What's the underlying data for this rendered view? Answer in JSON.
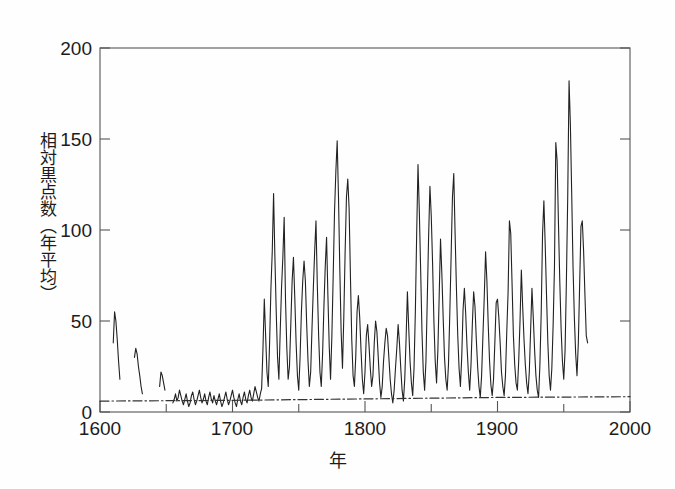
{
  "chart_data": {
    "type": "line",
    "title": "",
    "xlabel": "年",
    "ylabel": "相対黒点数（年平均）",
    "xlim": [
      1600,
      2000
    ],
    "ylim": [
      0,
      200
    ],
    "xticks": [
      1600,
      1700,
      1800,
      1900,
      2000
    ],
    "xtick_labels": [
      "1600",
      "1700",
      "1800",
      "1900",
      "2000"
    ],
    "xminor_step": 50,
    "yticks": [
      0,
      50,
      100,
      150,
      200
    ],
    "ytick_labels": [
      "0",
      "50",
      "100",
      "150",
      "200"
    ],
    "grid": false,
    "legend": null,
    "series": [
      {
        "name": "相対黒点数（年平均）",
        "style": "solid",
        "color": "#222222",
        "segments": [
          {
            "name": "1610-1615 fragment",
            "x": [
              1610,
              1611,
              1612,
              1613,
              1614,
              1615
            ],
            "values": [
              38,
              55,
              50,
              40,
              28,
              18
            ]
          },
          {
            "name": "1626-1632 fragment",
            "x": [
              1626,
              1627,
              1628,
              1629,
              1630,
              1631,
              1632
            ],
            "values": [
              30,
              35,
              32,
              25,
              20,
              14,
              10
            ]
          },
          {
            "name": "1645-1650 fragment",
            "x": [
              1645,
              1646,
              1647,
              1648,
              1649
            ],
            "values": [
              14,
              22,
              20,
              16,
              12
            ]
          },
          {
            "name": "1655-1985 continuous record",
            "x": [
              1655,
              1656,
              1657,
              1658,
              1659,
              1660,
              1661,
              1662,
              1663,
              1664,
              1665,
              1666,
              1667,
              1668,
              1669,
              1670,
              1671,
              1672,
              1673,
              1674,
              1675,
              1676,
              1677,
              1678,
              1679,
              1680,
              1681,
              1682,
              1683,
              1684,
              1685,
              1686,
              1687,
              1688,
              1689,
              1690,
              1691,
              1692,
              1693,
              1694,
              1695,
              1696,
              1697,
              1698,
              1699,
              1700,
              1701,
              1702,
              1703,
              1704,
              1705,
              1706,
              1707,
              1708,
              1709,
              1710,
              1711,
              1712,
              1713,
              1714,
              1715,
              1716,
              1717,
              1718,
              1719,
              1720,
              1721,
              1722,
              1723,
              1724,
              1725,
              1726,
              1727,
              1728,
              1729,
              1730,
              1731,
              1732,
              1733,
              1734,
              1735,
              1736,
              1737,
              1738,
              1739,
              1740,
              1741,
              1742,
              1743,
              1744,
              1745,
              1746,
              1747,
              1748,
              1749,
              1750,
              1751,
              1752,
              1753,
              1754,
              1755,
              1756,
              1757,
              1758,
              1759,
              1760,
              1761,
              1762,
              1763,
              1764,
              1765,
              1766,
              1767,
              1768,
              1769,
              1770,
              1771,
              1772,
              1773,
              1774,
              1775,
              1776,
              1777,
              1778,
              1779,
              1780,
              1781,
              1782,
              1783,
              1784,
              1785,
              1786,
              1787,
              1788,
              1789,
              1790,
              1791,
              1792,
              1793,
              1794,
              1795,
              1796,
              1797,
              1798,
              1799,
              1800,
              1801,
              1802,
              1803,
              1804,
              1805,
              1806,
              1807,
              1808,
              1809,
              1810,
              1811,
              1812,
              1813,
              1814,
              1815,
              1816,
              1817,
              1818,
              1819,
              1820,
              1821,
              1822,
              1823,
              1824,
              1825,
              1826,
              1827,
              1828,
              1829,
              1830,
              1831,
              1832,
              1833,
              1834,
              1835,
              1836,
              1837,
              1838,
              1839,
              1840,
              1841,
              1842,
              1843,
              1844,
              1845,
              1846,
              1847,
              1848,
              1849,
              1850,
              1851,
              1852,
              1853,
              1854,
              1855,
              1856,
              1857,
              1858,
              1859,
              1860,
              1861,
              1862,
              1863,
              1864,
              1865,
              1866,
              1867,
              1868,
              1869,
              1870,
              1871,
              1872,
              1873,
              1874,
              1875,
              1876,
              1877,
              1878,
              1879,
              1880,
              1881,
              1882,
              1883,
              1884,
              1885,
              1886,
              1887,
              1888,
              1889,
              1890,
              1891,
              1892,
              1893,
              1894,
              1895,
              1896,
              1897,
              1898,
              1899,
              1900,
              1901,
              1902,
              1903,
              1904,
              1905,
              1906,
              1907,
              1908,
              1909,
              1910,
              1911,
              1912,
              1913,
              1914,
              1915,
              1916,
              1917,
              1918,
              1919,
              1920,
              1921,
              1922,
              1923,
              1924,
              1925,
              1926,
              1927,
              1928,
              1929,
              1930,
              1931,
              1932,
              1933,
              1934,
              1935,
              1936,
              1937,
              1938,
              1939,
              1940,
              1941,
              1942,
              1943,
              1944,
              1945,
              1946,
              1947,
              1948,
              1949,
              1950,
              1951,
              1952,
              1953,
              1954,
              1955,
              1956,
              1957,
              1958,
              1959,
              1960,
              1961,
              1962,
              1963,
              1964,
              1965,
              1966,
              1967,
              1968,
              1969,
              1970,
              1971,
              1972,
              1973,
              1974,
              1975,
              1976,
              1977,
              1978,
              1979,
              1980,
              1981,
              1982
            ],
            "values": [
              5,
              7,
              10,
              6,
              8,
              12,
              9,
              6,
              4,
              7,
              10,
              6,
              3,
              5,
              9,
              11,
              7,
              4,
              6,
              9,
              12,
              8,
              5,
              7,
              10,
              6,
              4,
              8,
              11,
              7,
              5,
              9,
              6,
              4,
              7,
              10,
              6,
              3,
              5,
              8,
              11,
              7,
              4,
              6,
              9,
              12,
              8,
              5,
              3,
              7,
              10,
              6,
              4,
              8,
              11,
              7,
              5,
              9,
              12,
              8,
              6,
              10,
              14,
              11,
              8,
              6,
              10,
              13,
              35,
              62,
              42,
              22,
              14,
              38,
              68,
              88,
              120,
              85,
              55,
              30,
              18,
              44,
              68,
              85,
              107,
              62,
              35,
              18,
              25,
              48,
              72,
              85,
              63,
              38,
              20,
              12,
              30,
              55,
              72,
              83,
              72,
              48,
              28,
              14,
              22,
              46,
              68,
              88,
              105,
              70,
              42,
              22,
              14,
              32,
              58,
              80,
              96,
              64,
              36,
              18,
              42,
              75,
              110,
              132,
              149,
              118,
              78,
              44,
              24,
              52,
              88,
              118,
              128,
              112,
              75,
              40,
              20,
              14,
              30,
              55,
              64,
              52,
              34,
              18,
              10,
              22,
              42,
              48,
              37,
              24,
              14,
              20,
              38,
              50,
              44,
              30,
              16,
              8,
              14,
              28,
              38,
              46,
              42,
              30,
              18,
              10,
              5,
              12,
              24,
              35,
              48,
              38,
              24,
              12,
              6,
              18,
              40,
              66,
              46,
              28,
              16,
              9,
              24,
              55,
              98,
              136,
              110,
              78,
              44,
              22,
              12,
              28,
              62,
              96,
              124,
              108,
              82,
              50,
              28,
              16,
              34,
              64,
              95,
              76,
              52,
              30,
              18,
              12,
              26,
              54,
              86,
              118,
              131,
              98,
              68,
              42,
              24,
              14,
              30,
              56,
              68,
              54,
              36,
              22,
              12,
              26,
              48,
              66,
              58,
              40,
              25,
              14,
              8,
              20,
              42,
              63,
              88,
              72,
              48,
              28,
              15,
              9,
              18,
              38,
              60,
              62,
              52,
              38,
              22,
              14,
              9,
              20,
              44,
              66,
              105,
              98,
              70,
              42,
              26,
              16,
              12,
              28,
              50,
              78,
              58,
              40,
              26,
              16,
              10,
              22,
              45,
              68,
              52,
              34,
              20,
              12,
              8,
              26,
              55,
              98,
              116,
              92,
              64,
              38,
              20,
              12,
              24,
              48,
              80,
              148,
              138,
              104,
              72,
              46,
              28,
              18,
              34,
              72,
              118,
              182,
              158,
              120,
              80,
              52,
              32,
              20,
              38,
              70,
              102,
              105,
              88,
              64,
              42,
              38
            ]
          }
        ]
      },
      {
        "name": "baseline-reference",
        "style": "dash-dot",
        "color": "#333333",
        "segments": [
          {
            "name": "reference-line",
            "x": [
              1600,
              1700,
              1800,
              1900,
              2000
            ],
            "values": [
              6,
              6.4,
              7.2,
              8.0,
              8.4
            ]
          }
        ]
      }
    ]
  },
  "axis": {
    "y_title": "相対黒点数（年平均）",
    "x_title": "年",
    "yticks": [
      "200",
      "150",
      "100",
      "50",
      "0"
    ],
    "xticks": [
      "1600",
      "1700",
      "1800",
      "1900",
      "2000"
    ]
  }
}
